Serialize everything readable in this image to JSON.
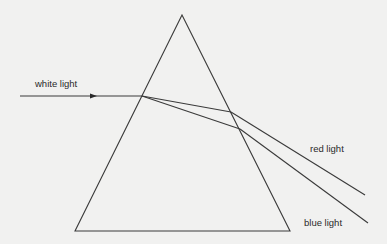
{
  "diagram": {
    "labels": {
      "white_light": "white light",
      "red_light": "red light",
      "blue_light": "blue light"
    },
    "colors": {
      "background": "#f1f1f0",
      "stroke": "#3a3a3a",
      "text": "#2a2a2a"
    },
    "prism": {
      "apex": [
        182,
        15
      ],
      "bottom_left": [
        75,
        231
      ],
      "bottom_right": [
        290,
        231
      ]
    },
    "rays": {
      "incident": {
        "from": [
          20,
          96
        ],
        "to": [
          142,
          96
        ],
        "arrow_at": [
          93,
          96
        ]
      },
      "red": {
        "entry": [
          142,
          96
        ],
        "exit": [
          231,
          112
        ],
        "end": [
          365,
          195
        ]
      },
      "blue": {
        "entry": [
          142,
          96
        ],
        "exit": [
          240,
          129
        ],
        "end": [
          368,
          223
        ]
      }
    }
  }
}
